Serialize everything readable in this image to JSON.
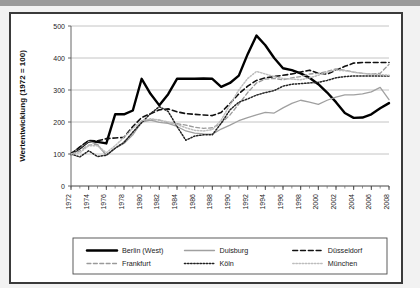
{
  "figure": {
    "background": "#ffffff",
    "border_color": "#3a3a3a"
  },
  "chart_data": {
    "type": "line",
    "title": "",
    "xlabel": "",
    "ylabel": "Wertentwicklung (1972 = 100)",
    "xlim": [
      1972,
      2008
    ],
    "ylim": [
      0,
      500
    ],
    "yticks": [
      0,
      100,
      200,
      300,
      400,
      500
    ],
    "xticks": [
      1972,
      1974,
      1976,
      1978,
      1980,
      1982,
      1984,
      1986,
      1988,
      1990,
      1992,
      1994,
      1996,
      1998,
      2000,
      2002,
      2004,
      2006,
      2008
    ],
    "xtick_labels": [
      "1972",
      "1974",
      "1976",
      "1978",
      "1980",
      "1982",
      "1984",
      "1986",
      "1988",
      "1990",
      "1992",
      "1994",
      "1996",
      "1998",
      "2000",
      "2002",
      "2004",
      "2006",
      "2008"
    ],
    "minor_xtick_interval": 1,
    "grid": "horizontal",
    "grid_color": "#b5b5b5",
    "legend_position": "bottom",
    "legend_columns": 3,
    "x": [
      1972,
      1973,
      1974,
      1975,
      1976,
      1977,
      1978,
      1979,
      1980,
      1981,
      1982,
      1983,
      1984,
      1985,
      1986,
      1987,
      1988,
      1989,
      1990,
      1991,
      1992,
      1993,
      1994,
      1995,
      1996,
      1997,
      1998,
      1999,
      2000,
      2001,
      2002,
      2003,
      2004,
      2005,
      2006,
      2007,
      2008
    ],
    "series": [
      {
        "name": "Berlin (West)",
        "color": "#000000",
        "style": "solid",
        "width": 2.4,
        "values": [
          100,
          118,
          140,
          138,
          133,
          224,
          224,
          236,
          335,
          288,
          252,
          287,
          335,
          335,
          335,
          336,
          335,
          310,
          322,
          345,
          412,
          470,
          440,
          400,
          368,
          362,
          352,
          338,
          318,
          292,
          262,
          228,
          213,
          214,
          224,
          243,
          259
        ]
      },
      {
        "name": "Duisburg",
        "color": "#a0a0a0",
        "style": "solid",
        "width": 1.3,
        "values": [
          100,
          120,
          140,
          129,
          96,
          118,
          133,
          160,
          200,
          206,
          199,
          196,
          186,
          172,
          165,
          163,
          162,
          178,
          190,
          204,
          214,
          222,
          230,
          228,
          244,
          258,
          268,
          262,
          255,
          268,
          278,
          285,
          285,
          288,
          294,
          308,
          270
        ]
      },
      {
        "name": "Düsseldorf",
        "color": "#111111",
        "style": "dashed",
        "width": 1.6,
        "values": [
          100,
          122,
          142,
          141,
          148,
          150,
          152,
          186,
          214,
          226,
          238,
          241,
          232,
          226,
          224,
          222,
          220,
          230,
          258,
          288,
          312,
          330,
          338,
          342,
          346,
          350,
          356,
          362,
          352,
          350,
          362,
          374,
          384,
          386,
          386,
          386,
          386
        ]
      },
      {
        "name": "Frankfurt",
        "color": "#9a9a9a",
        "style": "dashed",
        "width": 1.3,
        "values": [
          100,
          110,
          128,
          130,
          96,
          118,
          138,
          168,
          202,
          208,
          206,
          198,
          195,
          190,
          184,
          180,
          182,
          196,
          222,
          256,
          292,
          322,
          334,
          336,
          332,
          338,
          342,
          350,
          352,
          358,
          366,
          362,
          356,
          352,
          350,
          352,
          380
        ]
      },
      {
        "name": "Köln",
        "color": "#222222",
        "style": "dotted",
        "width": 1.5,
        "values": [
          100,
          91,
          110,
          92,
          96,
          118,
          136,
          168,
          198,
          226,
          248,
          233,
          186,
          143,
          156,
          160,
          160,
          196,
          238,
          262,
          272,
          284,
          292,
          298,
          312,
          318,
          320,
          322,
          324,
          330,
          338,
          342,
          344,
          344,
          344,
          344,
          344
        ]
      },
      {
        "name": "München",
        "color": "#bdbdbd",
        "style": "dotted",
        "width": 1.5,
        "values": [
          100,
          104,
          126,
          126,
          104,
          126,
          152,
          180,
          204,
          210,
          206,
          200,
          192,
          182,
          174,
          172,
          176,
          206,
          254,
          300,
          336,
          358,
          350,
          342,
          336,
          334,
          332,
          338,
          346,
          356,
          362,
          360,
          356,
          352,
          350,
          348,
          346
        ]
      }
    ]
  },
  "legend": {
    "entries": [
      {
        "label": "Berlin (West)"
      },
      {
        "label": "Duisburg"
      },
      {
        "label": "Düsseldorf"
      },
      {
        "label": "Frankfurt"
      },
      {
        "label": "Köln"
      },
      {
        "label": "München"
      }
    ]
  }
}
